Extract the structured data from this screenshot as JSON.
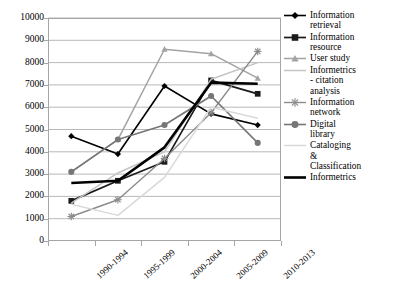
{
  "chart_data": {
    "type": "line",
    "title": "",
    "xlabel": "",
    "ylabel": "",
    "categories": [
      "1990-1994",
      "1995-1999",
      "2000-2004",
      "2005-2009",
      "2010-2013"
    ],
    "ylim": [
      0,
      10000
    ],
    "ytick_step": 1000,
    "ytick_labels": [
      "10000",
      "9000",
      "8000",
      "7000",
      "6000",
      "5000",
      "4000",
      "3000",
      "2000",
      "1000",
      "0"
    ],
    "grid": true,
    "legend_position": "right",
    "series": [
      {
        "name": "Information\nretrieval",
        "legend_label": "Information\nretrieval",
        "marker": "diamond",
        "color": "#000000",
        "line_width": 1.6,
        "values": [
          4700,
          3900,
          6950,
          5700,
          5200
        ]
      },
      {
        "name": "Information\nresource",
        "legend_label": "Information\nresource",
        "marker": "square",
        "color": "#1a1a1a",
        "line_width": 1.7,
        "values": [
          1800,
          2700,
          3550,
          7200,
          6600
        ]
      },
      {
        "name": "User study",
        "legend_label": "User study",
        "marker": "triangle",
        "color": "#a3a3a3",
        "line_width": 1.5,
        "values": [
          3100,
          4550,
          8600,
          8400,
          7300
        ]
      },
      {
        "name": "Informetrics - citation analysis",
        "legend_label": "Informetrics\n- citation\nanalysis",
        "marker": "none",
        "color": "#c4c4c4",
        "line_width": 1.5,
        "values": [
          1700,
          3050,
          4000,
          7250,
          8000
        ]
      },
      {
        "name": "Information\nnetwork",
        "legend_label": "Information\nnetwork",
        "marker": "asterisk",
        "color": "#8c8c8c",
        "line_width": 1.4,
        "values": [
          1100,
          1850,
          3700,
          5750,
          8500
        ]
      },
      {
        "name": "Digital\nlibrary",
        "legend_label": "Digital\nlibrary",
        "marker": "circle",
        "color": "#767676",
        "line_width": 1.6,
        "values": [
          3100,
          4550,
          5200,
          6500,
          4400
        ]
      },
      {
        "name": "Cataloging & Classification",
        "legend_label": "Cataloging\n&\nClassification",
        "marker": "none",
        "color": "#d9d9d9",
        "line_width": 1.5,
        "values": [
          1650,
          1150,
          2850,
          6000,
          5500
        ]
      },
      {
        "name": "Informetrics",
        "legend_label": "Informetrics",
        "marker": "none",
        "color": "#000000",
        "line_width": 2.6,
        "values": [
          2600,
          2700,
          4200,
          7100,
          7050
        ]
      }
    ]
  },
  "axes": {
    "grid_color": "#a6a6a6",
    "frame_color": "#a6a6a6"
  }
}
